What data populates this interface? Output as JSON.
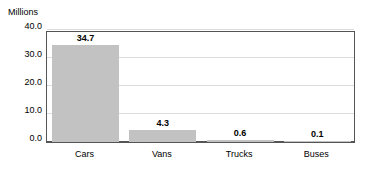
{
  "chart_data": {
    "type": "bar",
    "title": "",
    "subtitle": "",
    "xlabel": "",
    "ylabel": "Millions",
    "categories": [
      "Cars",
      "Vans",
      "Trucks",
      "Buses"
    ],
    "values": [
      34.7,
      4.3,
      0.6,
      0.1
    ],
    "value_labels": [
      "34.7",
      "4.3",
      "0.6",
      "0.1"
    ],
    "ylim": [
      0.0,
      40.0
    ],
    "yticks": [
      0.0,
      10.0,
      20.0,
      30.0,
      40.0
    ],
    "ytick_labels": [
      "0.0",
      "10.0",
      "20.0",
      "30.0",
      "40.0"
    ],
    "grid": true,
    "legend": false,
    "legend_position": "none",
    "bar_color": "#c2c2c2",
    "grid_color": "#dcdcdc",
    "axis_color": "#555555",
    "background_color": "#ffffff"
  }
}
